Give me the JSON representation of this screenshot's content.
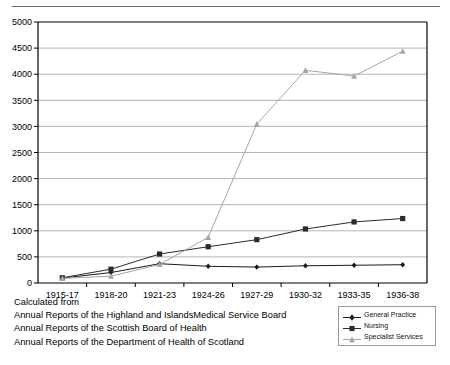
{
  "chart_data": {
    "type": "line",
    "title": "",
    "xlabel": "",
    "ylabel": "",
    "ylim": [
      0,
      5000
    ],
    "ytick_step": 500,
    "grid": true,
    "legend_position": "bottom-right",
    "categories": [
      "1915-17",
      "1918-20",
      "1921-23",
      "1924-26",
      "1927-29",
      "1930-32",
      "1933-35",
      "1936-38"
    ],
    "yticks": [
      "0",
      "500",
      "1000",
      "1500",
      "2000",
      "2500",
      "3000",
      "3500",
      "4000",
      "4500",
      "5000"
    ],
    "series": [
      {
        "name": "General Practice",
        "marker": "diamond",
        "color": "#1a1a1a",
        "values": [
          95,
          200,
          370,
          320,
          305,
          330,
          340,
          350
        ]
      },
      {
        "name": "Nursing",
        "marker": "square",
        "color": "#2b2b2b",
        "values": [
          100,
          265,
          555,
          695,
          830,
          1035,
          1170,
          1235
        ]
      },
      {
        "name": "Specialist Services",
        "marker": "triangle",
        "color": "#a6a6a6",
        "values": [
          90,
          130,
          355,
          875,
          3045,
          4075,
          3965,
          4440
        ]
      }
    ]
  },
  "footer": {
    "lines": [
      "Calculated from",
      "Annual Reports of the Highland and IslandsMedical Service Board",
      "Annual Reports of the Scottish Board of Health",
      "Annual Reports of the Department of Health of Scotland"
    ]
  },
  "legend": {
    "items": [
      {
        "label": "General Practice"
      },
      {
        "label": "Nursing"
      },
      {
        "label": "Specialist Services"
      }
    ]
  },
  "colors": {
    "axis": "#000000",
    "grid": "#b5b5b5",
    "series_general_practice": "#1a1a1a",
    "series_nursing": "#2b2b2b",
    "series_specialist": "#a6a6a6",
    "top_rule": "#6a6a6a"
  }
}
